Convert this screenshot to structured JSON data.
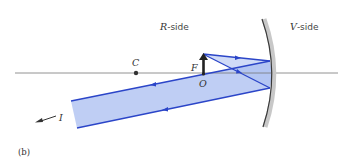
{
  "figure": {
    "panel_label": "(b)",
    "labels": {
      "r_side_italic": "R",
      "r_side_rest": "-side",
      "v_side_italic": "V",
      "v_side_rest": "-side",
      "center": "C",
      "focal": "F",
      "object": "O",
      "image": "I"
    },
    "colors": {
      "ray": "#2b45c8",
      "beam_fill": "#a9bdf0",
      "mirror": "#3a3a3a",
      "mirror_shadow": "#c8c8c8",
      "axis": "#777777",
      "object_arrow": "#222222"
    }
  }
}
